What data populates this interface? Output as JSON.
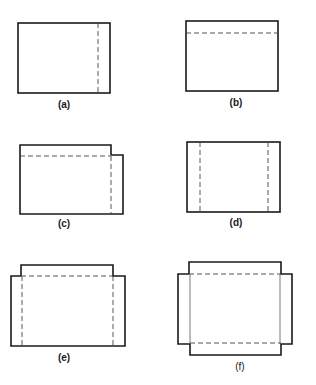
{
  "figure": {
    "panels": [
      {
        "id": "a",
        "label": "(a)",
        "description": "Rectangle with one dashed fold line near the right edge"
      },
      {
        "id": "b",
        "label": "(b)",
        "description": "Rectangle with one dashed fold line near the top edge"
      },
      {
        "id": "c",
        "label": "(c)",
        "description": "Rectangle with top fold and right flap extending out, dashed fold lines"
      },
      {
        "id": "d",
        "label": "(d)",
        "description": "Rectangle with dashed fold lines near both left and right edges"
      },
      {
        "id": "e",
        "label": "(e)",
        "description": "Rectangle with raised top tab and dashed fold lines on top, left and right"
      },
      {
        "id": "f",
        "label": "(f)",
        "description": "Cross-shaped outline with top/bottom tabs and side flaps, dashed fold lines top and bottom"
      }
    ]
  }
}
